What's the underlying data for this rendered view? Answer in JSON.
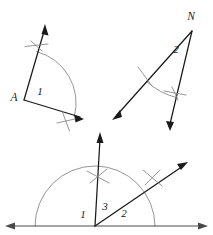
{
  "figure": {
    "background_color": "#ffffff",
    "line_color": "#1a1a1a",
    "arc_color": "#8a8a8a",
    "baseline_color": "#4a4a4a",
    "width": 213,
    "height": 235
  },
  "figures": [
    {
      "id": "figure-a",
      "name": "angle-a",
      "vertex_label": "A",
      "angle_label": "1",
      "vertex_label_pos": {
        "x": 14,
        "y": 98
      },
      "angle_label_pos": {
        "x": 40,
        "y": 92
      },
      "rays": [
        {
          "name": "ray-a-upper",
          "x1": 24,
          "y1": 100,
          "x2": 45,
          "y2": 27
        },
        {
          "name": "ray-a-lower",
          "x1": 24,
          "y1": 100,
          "x2": 81,
          "y2": 117
        }
      ],
      "arrowheads": [
        {
          "name": "arrowhead-a-upper",
          "x": 45,
          "y": 25,
          "angle": -74
        },
        {
          "name": "arrowhead-a-lower",
          "x": 83,
          "y": 118,
          "angle": 17
        }
      ],
      "arc": {
        "name": "construction-arc-a",
        "cx": 24,
        "cy": 100,
        "r": 53,
        "start_deg": -76,
        "end_deg": 18
      },
      "ticks": [
        {
          "name": "tick-a-upper-1",
          "x1": 26,
          "y1": 46,
          "x2": 47,
          "y2": 44
        },
        {
          "name": "tick-a-upper-2",
          "x1": 31,
          "y1": 42,
          "x2": 42,
          "y2": 50
        },
        {
          "name": "tick-a-lower-1",
          "x1": 62,
          "y1": 112,
          "x2": 69,
          "y2": 130
        },
        {
          "name": "tick-a-lower-2",
          "x1": 58,
          "y1": 122,
          "x2": 74,
          "y2": 119
        }
      ]
    },
    {
      "id": "figure-n",
      "name": "angle-n",
      "vertex_label": "N",
      "angle_label": "2",
      "vertex_label_pos": {
        "x": 191,
        "y": 17
      },
      "angle_label_pos": {
        "x": 176,
        "y": 50
      },
      "rays": [
        {
          "name": "ray-n-left",
          "x1": 192,
          "y1": 31,
          "x2": 116,
          "y2": 116
        },
        {
          "name": "ray-n-down",
          "x1": 192,
          "y1": 31,
          "x2": 170,
          "y2": 126
        }
      ],
      "arrowheads": [
        {
          "name": "arrowhead-n-left",
          "x": 113,
          "y": 119,
          "angle": 132
        },
        {
          "name": "arrowhead-n-down",
          "x": 170,
          "y": 130,
          "angle": 103
        }
      ],
      "arc": {
        "name": "construction-arc-n",
        "cx": 192,
        "cy": 31,
        "r": 68,
        "start_deg": 103,
        "end_deg": 132
      },
      "ticks": [
        {
          "name": "tick-n-left-1",
          "x1": 139,
          "y1": 68,
          "x2": 152,
          "y2": 85
        },
        {
          "name": "tick-n-right-1",
          "x1": 165,
          "y1": 91,
          "x2": 184,
          "y2": 94
        },
        {
          "name": "tick-n-right-2",
          "x1": 172,
          "y1": 88,
          "x2": 177,
          "y2": 99
        }
      ]
    },
    {
      "id": "figure-bottom",
      "name": "angle-bisector-construction",
      "vertex_label": "",
      "angle_labels": [
        "1",
        "3",
        "2"
      ],
      "label_positions": [
        {
          "text": "1",
          "x": 83,
          "y": 215
        },
        {
          "text": "3",
          "x": 104,
          "y": 208
        },
        {
          "text": "2",
          "x": 123,
          "y": 214
        }
      ],
      "baseline": {
        "name": "baseline-horizontal",
        "x1": 9,
        "y1": 226,
        "x2": 204,
        "y2": 226
      },
      "baseline_arrowheads": [
        {
          "name": "arrowhead-baseline-left",
          "x": 6,
          "y": 226,
          "angle": 180
        },
        {
          "name": "arrowhead-baseline-right",
          "x": 207,
          "y": 226,
          "angle": 0
        }
      ],
      "vertex": {
        "x": 95,
        "y": 226
      },
      "rays": [
        {
          "name": "ray-vertical",
          "x1": 95,
          "y1": 226,
          "x2": 100,
          "y2": 137
        },
        {
          "name": "ray-diagonal",
          "x1": 95,
          "y1": 226,
          "x2": 184,
          "y2": 165
        }
      ],
      "arrowheads": [
        {
          "name": "arrowhead-vertical",
          "x": 100,
          "y": 133,
          "angle": -87
        },
        {
          "name": "arrowhead-diagonal",
          "x": 187,
          "y": 163,
          "angle": -34
        }
      ],
      "arc": {
        "name": "construction-arc-bottom",
        "cx": 95,
        "cy": 226,
        "r": 60,
        "start_deg": 180,
        "end_deg": 0
      },
      "ticks": [
        {
          "name": "tick-bottom-vertical-1",
          "x1": 88,
          "y1": 172,
          "x2": 108,
          "y2": 182
        },
        {
          "name": "tick-bottom-vertical-2",
          "x1": 91,
          "y1": 182,
          "x2": 106,
          "y2": 170
        },
        {
          "name": "tick-bottom-diagonal-1",
          "x1": 144,
          "y1": 171,
          "x2": 161,
          "y2": 185
        },
        {
          "name": "tick-bottom-diagonal-2",
          "x1": 146,
          "y1": 184,
          "x2": 159,
          "y2": 171
        }
      ]
    }
  ]
}
